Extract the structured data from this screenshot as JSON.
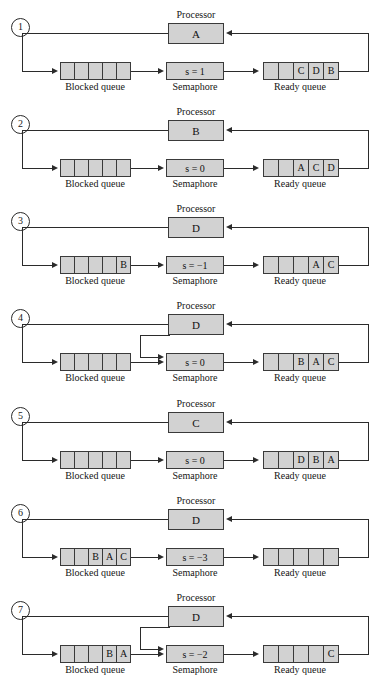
{
  "figure": {
    "type": "diagram",
    "labels": {
      "processor": "Processor",
      "semaphore": "Semaphore",
      "blocked_queue": "Blocked queue",
      "ready_queue": "Ready queue"
    },
    "colors": {
      "box_fill": "#d2d2d2",
      "box_border": "#3a3a3a",
      "line": "#2b2b2b",
      "background": "#ffffff"
    },
    "queue_cell_count": 5
  },
  "panels": [
    {
      "step": "1",
      "processor": "A",
      "semaphore": "s = 1",
      "blocked_queue": [
        "",
        "",
        "",
        "",
        ""
      ],
      "ready_queue": [
        "",
        "",
        "C",
        "D",
        "B"
      ],
      "has_processor_to_semaphore_arrow": false
    },
    {
      "step": "2",
      "processor": "B",
      "semaphore": "s = 0",
      "blocked_queue": [
        "",
        "",
        "",
        "",
        ""
      ],
      "ready_queue": [
        "",
        "",
        "A",
        "C",
        "D"
      ],
      "has_processor_to_semaphore_arrow": false
    },
    {
      "step": "3",
      "processor": "D",
      "semaphore": "s = −1",
      "blocked_queue": [
        "",
        "",
        "",
        "",
        "B"
      ],
      "ready_queue": [
        "",
        "",
        "",
        "A",
        "C"
      ],
      "has_processor_to_semaphore_arrow": false
    },
    {
      "step": "4",
      "processor": "D",
      "semaphore": "s = 0",
      "blocked_queue": [
        "",
        "",
        "",
        "",
        ""
      ],
      "ready_queue": [
        "",
        "",
        "B",
        "A",
        "C"
      ],
      "has_processor_to_semaphore_arrow": true
    },
    {
      "step": "5",
      "processor": "C",
      "semaphore": "s = 0",
      "blocked_queue": [
        "",
        "",
        "",
        "",
        ""
      ],
      "ready_queue": [
        "",
        "",
        "D",
        "B",
        "A"
      ],
      "has_processor_to_semaphore_arrow": false
    },
    {
      "step": "6",
      "processor": "D",
      "semaphore": "s = −3",
      "blocked_queue": [
        "",
        "",
        "B",
        "A",
        "C"
      ],
      "ready_queue": [
        "",
        "",
        "",
        "",
        ""
      ],
      "has_processor_to_semaphore_arrow": false
    },
    {
      "step": "7",
      "processor": "D",
      "semaphore": "s = −2",
      "blocked_queue": [
        "",
        "",
        "",
        "B",
        "A"
      ],
      "ready_queue": [
        "",
        "",
        "",
        "",
        "C"
      ],
      "has_processor_to_semaphore_arrow": true
    }
  ]
}
